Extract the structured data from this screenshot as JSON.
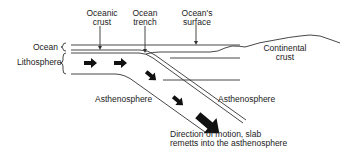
{
  "diagram": {
    "type": "subduction-zone-cross-section",
    "labels": {
      "oceanic_crust": "Oceanic\ncrust",
      "ocean_trench": "Ocean\ntrench",
      "oceans_surface": "Ocean's\nsurface",
      "continental_crust": "Continental\ncrust",
      "ocean": "Ocean",
      "lithosphere": "Lithosphere",
      "asthenosphere_left": "Asthenosphere",
      "asthenosphere_right": "Asthenosphere",
      "direction": "Direction of motion, slab\nremetts into the asthenosphere"
    },
    "colors": {
      "line": "#333333",
      "arrow": "#111111",
      "background": "#ffffff"
    }
  }
}
